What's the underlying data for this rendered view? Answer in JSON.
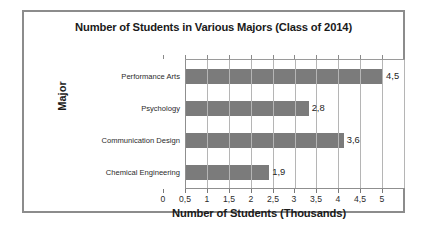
{
  "chart_data": {
    "type": "bar",
    "orientation": "horizontal",
    "title": "Number of Students in Various Majors (Class of 2014)",
    "xlabel": "Number of Students (Thousands)",
    "ylabel": "Major",
    "categories": [
      "Performance Arts",
      "Psychology",
      "Communication Design",
      "Chemical Engineering"
    ],
    "values": [
      4.5,
      2.8,
      3.6,
      1.9
    ],
    "value_labels": [
      "4,5",
      "2,8",
      "3,6",
      "1,9"
    ],
    "xlim": [
      0,
      5
    ],
    "xticks": [
      0,
      0.5,
      1,
      1.5,
      2,
      2.5,
      3,
      3.5,
      4,
      4.5,
      5
    ],
    "xtick_labels": [
      "0",
      "0,5",
      "1",
      "1,5",
      "2",
      "2,5",
      "3",
      "3,5",
      "4",
      "4,5",
      "5"
    ],
    "grid": true,
    "grid_axis": "x",
    "legend": false,
    "decimal_separator": ",",
    "bar_color": "#7b7b7b",
    "gridline_color": "#b5b5b5",
    "frame_color": "#8c8c8c",
    "background_color": "#ffffff",
    "text_color": "#1a1a1a"
  }
}
